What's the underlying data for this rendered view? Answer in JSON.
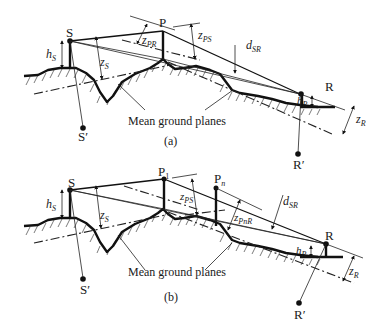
{
  "figure": {
    "panels": [
      {
        "id": "a",
        "caption": "(a)",
        "labels": {
          "S": "S",
          "S_prime": "S′",
          "P": "P",
          "R": "R",
          "R_prime": "R′",
          "h_S": {
            "main": "h",
            "sub": "S"
          },
          "z_S": {
            "main": "z",
            "sub": "S"
          },
          "z_PR": {
            "main": "z",
            "sub": "PR"
          },
          "z_PS": {
            "main": "z",
            "sub": "PS"
          },
          "d_SR": {
            "main": "d",
            "sub": "SR"
          },
          "h_R": {
            "main": "h",
            "sub": "R"
          },
          "z_R": {
            "main": "z",
            "sub": "R"
          },
          "mean_ground_planes": "Mean ground planes"
        }
      },
      {
        "id": "b",
        "caption": "(b)",
        "labels": {
          "S": "S",
          "S_prime": "S′",
          "P1": {
            "main": "P",
            "sub": "1"
          },
          "Pn": {
            "main": "P",
            "sub": "n"
          },
          "R": "R",
          "R_prime": "R′",
          "h_S": {
            "main": "h",
            "sub": "S"
          },
          "z_S": {
            "main": "z",
            "sub": "S"
          },
          "z_PS": {
            "main": "z",
            "sub": "PS"
          },
          "z_PnR": {
            "main": "z",
            "sub": "PnR"
          },
          "d_SR": {
            "main": "d",
            "sub": "SR"
          },
          "h_R": {
            "main": "h",
            "sub": "R"
          },
          "z_R": {
            "main": "z",
            "sub": "R"
          },
          "mean_ground_planes": "Mean ground planes"
        }
      }
    ]
  }
}
